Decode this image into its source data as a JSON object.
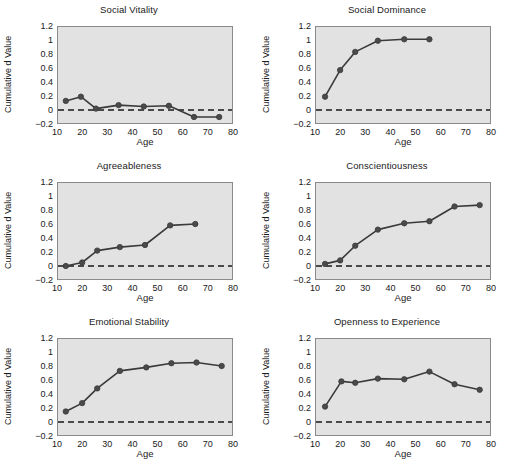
{
  "figure": {
    "background_color": "#ffffff",
    "panel_background_color": "#e2e2e2",
    "line_color": "#3a3a3a",
    "marker_color": "#4a4a4a",
    "axis_color": "#8a8a8a",
    "zero_line_color": "#4a4a4a"
  },
  "axes": {
    "xlabel": "Age",
    "ylabel": "Cumulative d Value",
    "xticks": [
      "10",
      "20",
      "30",
      "40",
      "50",
      "60",
      "70",
      "80"
    ],
    "xtick_values": [
      10,
      20,
      30,
      40,
      50,
      60,
      70,
      80
    ],
    "yticks": [
      "1.2",
      "1",
      "0.8",
      "0.6",
      "0.4",
      "0.2",
      "0",
      "−0.2"
    ],
    "ytick_values": [
      1.2,
      1.0,
      0.8,
      0.6,
      0.4,
      0.2,
      0,
      -0.2
    ],
    "xlim": [
      10,
      80
    ],
    "ylim": [
      -0.2,
      1.2
    ],
    "grid": false,
    "zero_reference_line": 0
  },
  "chart_data": [
    {
      "type": "line",
      "title": "Social Vitality",
      "xlabel": "Age",
      "ylabel": "Cumulative d Value",
      "xlim": [
        10,
        80
      ],
      "ylim": [
        -0.2,
        1.2
      ],
      "grid": false,
      "x": [
        13.5,
        19.5,
        25.5,
        34.5,
        44.5,
        54.5,
        64.5,
        74.5
      ],
      "values": [
        0.13,
        0.19,
        0.02,
        0.07,
        0.05,
        0.06,
        -0.1,
        -0.1
      ]
    },
    {
      "type": "line",
      "title": "Social Dominance",
      "xlabel": "Age",
      "ylabel": "Cumulative d Value",
      "xlim": [
        10,
        80
      ],
      "ylim": [
        -0.2,
        1.2
      ],
      "grid": false,
      "x": [
        14,
        20,
        26,
        35,
        45.5,
        55.5
      ],
      "values": [
        0.19,
        0.57,
        0.83,
        0.99,
        1.01,
        1.01
      ]
    },
    {
      "type": "line",
      "title": "Agreeableness",
      "xlabel": "Age",
      "ylabel": "Cumulative d Value",
      "xlim": [
        10,
        80
      ],
      "ylim": [
        -0.2,
        1.2
      ],
      "grid": false,
      "x": [
        13.5,
        20,
        26,
        35,
        45,
        55,
        65
      ],
      "values": [
        0.0,
        0.05,
        0.22,
        0.27,
        0.3,
        0.58,
        0.6
      ]
    },
    {
      "type": "line",
      "title": "Conscientiousness",
      "xlabel": "Age",
      "ylabel": "Cumulative d Value",
      "xlim": [
        10,
        80
      ],
      "ylim": [
        -0.2,
        1.2
      ],
      "grid": false,
      "x": [
        14,
        20,
        26,
        35,
        45.5,
        55.5,
        65.5,
        75.5
      ],
      "values": [
        0.03,
        0.08,
        0.29,
        0.52,
        0.61,
        0.64,
        0.85,
        0.87
      ]
    },
    {
      "type": "line",
      "title": "Emotional Stability",
      "xlabel": "Age",
      "ylabel": "Cumulative d Value",
      "xlim": [
        10,
        80
      ],
      "ylim": [
        -0.2,
        1.2
      ],
      "grid": false,
      "x": [
        13.5,
        20,
        26,
        35,
        45.5,
        55.5,
        65.5,
        75.5
      ],
      "values": [
        0.15,
        0.27,
        0.48,
        0.73,
        0.78,
        0.84,
        0.85,
        0.8
      ]
    },
    {
      "type": "line",
      "title": "Openness to Experience",
      "xlabel": "Age",
      "ylabel": "Cumulative d Value",
      "xlim": [
        10,
        80
      ],
      "ylim": [
        -0.2,
        1.2
      ],
      "grid": false,
      "x": [
        14,
        20.5,
        26,
        35,
        45.5,
        55.5,
        65.5,
        75.5
      ],
      "values": [
        0.22,
        0.58,
        0.56,
        0.62,
        0.61,
        0.72,
        0.54,
        0.46
      ]
    }
  ]
}
